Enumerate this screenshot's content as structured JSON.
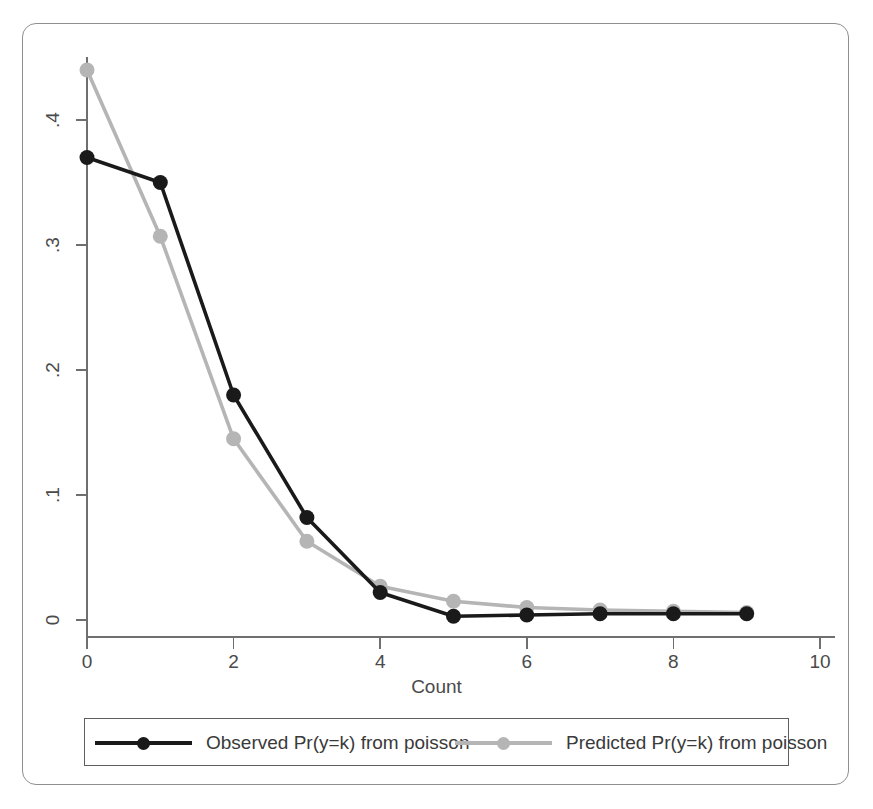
{
  "chart_data": {
    "type": "line",
    "title": "",
    "subtitle": "",
    "xlabel": "Count",
    "ylabel": "",
    "x": [
      0,
      1,
      2,
      3,
      4,
      5,
      6,
      7,
      8,
      9
    ],
    "xlim": [
      0,
      10
    ],
    "ylim": [
      0,
      0.46
    ],
    "grid": false,
    "legend_position": "bottom",
    "xticks": [
      "0",
      "2",
      "4",
      "6",
      "8",
      "10"
    ],
    "xtick_values": [
      0,
      2,
      4,
      6,
      8,
      10
    ],
    "yticks": [
      "0",
      ".1",
      ".2",
      ".3",
      ".4"
    ],
    "ytick_values": [
      0,
      0.1,
      0.2,
      0.3,
      0.4
    ],
    "series": [
      {
        "name": "Observed Pr(y=k) from poisson",
        "color": "#1a1a1a",
        "marker": "circle",
        "x": [
          0,
          1,
          2,
          3,
          4,
          5,
          6,
          7,
          8,
          9
        ],
        "values": [
          0.37,
          0.35,
          0.18,
          0.082,
          0.022,
          0.003,
          0.004,
          0.005,
          0.005,
          0.005
        ]
      },
      {
        "name": "Predicted Pr(y=k) from poisson",
        "color": "#b5b5b5",
        "marker": "circle",
        "x": [
          0,
          1,
          2,
          3,
          4,
          5,
          6,
          7,
          8,
          9
        ],
        "values": [
          0.44,
          0.307,
          0.145,
          0.063,
          0.027,
          0.015,
          0.01,
          0.008,
          0.007,
          0.006
        ]
      }
    ]
  },
  "axis": {
    "x_title": "Count",
    "x_tick_labels": [
      "0",
      "2",
      "4",
      "6",
      "8",
      "10"
    ],
    "y_tick_labels": [
      ".4",
      ".3",
      ".2",
      ".1",
      "0"
    ]
  },
  "legend": {
    "entries": [
      {
        "label": "Observed Pr(y=k) from poisson",
        "color": "#1a1a1a",
        "key": "line-marker-key"
      },
      {
        "label": "Predicted Pr(y=k) from poisson",
        "color": "#b5b5b5",
        "key": "line-marker-key"
      }
    ]
  },
  "colors": {
    "observed": "#1a1a1a",
    "predicted": "#b5b5b5",
    "axis": "#6f6f6f",
    "frame": "#8f8f8f",
    "text": "#4a4a4a",
    "background": "#ffffff"
  }
}
